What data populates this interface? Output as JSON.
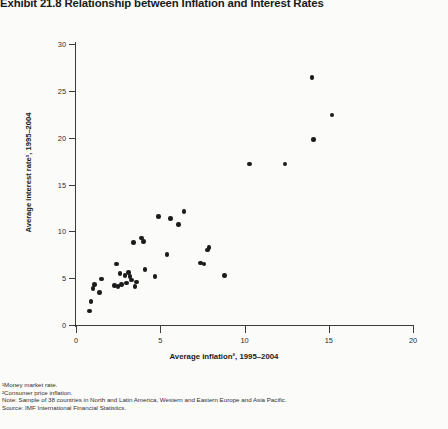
{
  "title": "Exhibit 21.8 Relationship between Inflation and Interest Rates",
  "axes": {
    "y_label": "Average interest rate¹, 1995–2004",
    "x_label": "Average inflation², 1995–2004",
    "y_ticks": [
      "0",
      "5",
      "10",
      "15",
      "20",
      "25",
      "30"
    ],
    "x_ticks": [
      "0",
      "5",
      "10",
      "15",
      "20"
    ]
  },
  "footnotes": {
    "note1": "¹Money market rate.",
    "note2": "²Consumer price inflation.",
    "note3": "Note: Sample of 38 countries in North and Latin America, Western and Eastern Europe and Asia Pacific.",
    "source": "Source: IMF International Financial Statistics."
  },
  "colors": {
    "marker": "#1b1b1b",
    "axis": "#3c3c3c",
    "background": "#fbfbfa",
    "text": "#231f20"
  },
  "chart_data": {
    "type": "scatter",
    "title": "Exhibit 21.8 Relationship between Inflation and Interest Rates",
    "xlabel": "Average inflation², 1995–2004",
    "ylabel": "Average interest rate¹, 1995–2004",
    "xlim": [
      0,
      20
    ],
    "ylim": [
      0,
      30
    ],
    "xticks": [
      0,
      5,
      10,
      15,
      20
    ],
    "yticks": [
      0,
      5,
      10,
      15,
      20,
      25,
      30
    ],
    "grid": false,
    "legend": null,
    "n_points": 38,
    "points": [
      {
        "x": 0.8,
        "y": 1.5
      },
      {
        "x": 0.9,
        "y": 2.5
      },
      {
        "x": 1.0,
        "y": 3.9
      },
      {
        "x": 1.4,
        "y": 3.5
      },
      {
        "x": 1.5,
        "y": 4.9
      },
      {
        "x": 2.3,
        "y": 4.2
      },
      {
        "x": 2.4,
        "y": 6.5
      },
      {
        "x": 2.5,
        "y": 4.1
      },
      {
        "x": 2.6,
        "y": 5.5
      },
      {
        "x": 2.7,
        "y": 4.3
      },
      {
        "x": 3.0,
        "y": 4.5
      },
      {
        "x": 3.1,
        "y": 5.6
      },
      {
        "x": 3.2,
        "y": 5.2
      },
      {
        "x": 3.3,
        "y": 4.8
      },
      {
        "x": 3.4,
        "y": 8.8
      },
      {
        "x": 3.5,
        "y": 4.1
      },
      {
        "x": 3.9,
        "y": 9.3
      },
      {
        "x": 4.0,
        "y": 8.9
      },
      {
        "x": 4.1,
        "y": 5.9
      },
      {
        "x": 4.7,
        "y": 5.2
      },
      {
        "x": 4.9,
        "y": 11.6
      },
      {
        "x": 5.4,
        "y": 7.5
      },
      {
        "x": 5.6,
        "y": 11.4
      },
      {
        "x": 6.1,
        "y": 10.7
      },
      {
        "x": 6.4,
        "y": 12.1
      },
      {
        "x": 7.4,
        "y": 6.6
      },
      {
        "x": 7.6,
        "y": 6.5
      },
      {
        "x": 7.8,
        "y": 8.0
      },
      {
        "x": 7.9,
        "y": 8.3
      },
      {
        "x": 8.8,
        "y": 5.3
      },
      {
        "x": 10.3,
        "y": 17.2
      },
      {
        "x": 12.4,
        "y": 17.2
      },
      {
        "x": 14.0,
        "y": 26.4
      },
      {
        "x": 14.1,
        "y": 19.8
      },
      {
        "x": 15.2,
        "y": 22.4
      },
      {
        "x": 1.1,
        "y": 4.3
      },
      {
        "x": 2.9,
        "y": 5.3
      },
      {
        "x": 3.6,
        "y": 4.6
      }
    ]
  }
}
